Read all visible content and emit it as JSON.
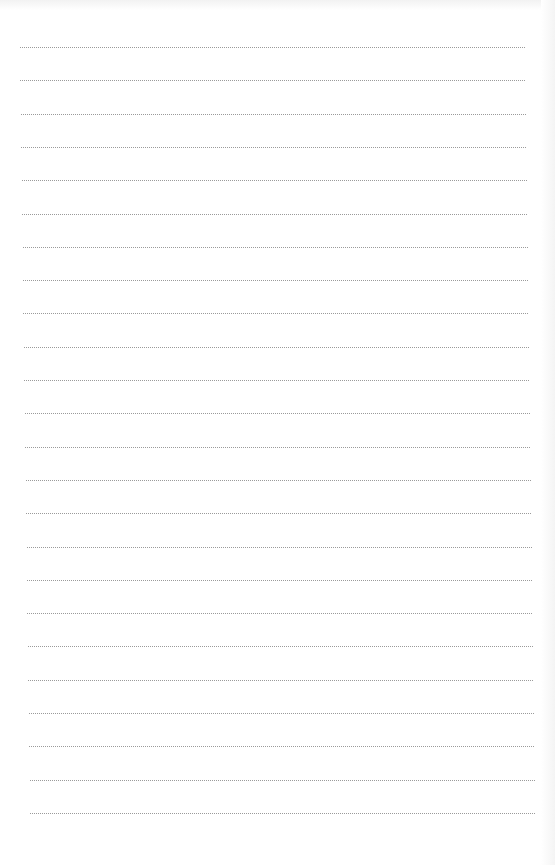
{
  "page": {
    "type": "lined-paper",
    "background": "#ffffff",
    "line_color": "#9a9a9a",
    "line_style": "dotted",
    "line_count": 24,
    "first_line_y": 47,
    "line_spacing": 33.3,
    "first_line_x": [
      20,
      525
    ],
    "last_line_x": [
      30,
      535
    ]
  }
}
